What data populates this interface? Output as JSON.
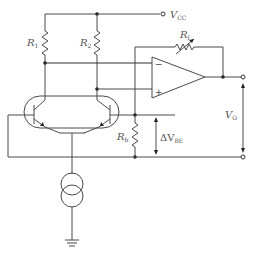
{
  "diagram": {
    "type": "circuit-schematic",
    "labels": {
      "vcc": {
        "main": "V",
        "sub": "CC"
      },
      "r1": {
        "main": "R",
        "sub": "1"
      },
      "r2": {
        "main": "R",
        "sub": "2"
      },
      "rf": {
        "main": "R",
        "sub": "f"
      },
      "rb": {
        "main": "R",
        "sub": "b"
      },
      "delta_vbe": {
        "main": "ΔV",
        "sub": "BE"
      },
      "vo": {
        "main": "V",
        "sub": "O"
      }
    },
    "opamp": {
      "inverting_sign": "−",
      "noninverting_sign": "+"
    },
    "components": [
      "R1 resistor",
      "R2 resistor",
      "Rf variable feedback resistor",
      "Rb resistor",
      "Op-amp",
      "Matched NPN transistor pair",
      "Current source",
      "Ground"
    ],
    "colors": {
      "wire": "#4a4a4a",
      "text": "#555555",
      "background": "#ffffff"
    }
  }
}
